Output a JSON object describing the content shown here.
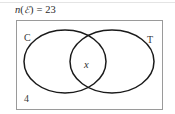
{
  "problem": {
    "statement_function": "n",
    "statement_open": "(",
    "statement_universal_symbol": "ℰ",
    "statement_close": ")",
    "statement_equals": "=",
    "statement_total": "23",
    "statement_full": "n(ℰ) = 23"
  },
  "diagram": {
    "type": "venn-two-set",
    "universal_rectangle_label": "",
    "sets": [
      {
        "id": "C",
        "label": "C",
        "position": "top-left"
      },
      {
        "id": "T",
        "label": "T",
        "position": "top-right"
      }
    ],
    "regions": [
      {
        "id": "intersection",
        "label": "x",
        "description": "C and T"
      },
      {
        "id": "outside",
        "label": "4",
        "description": "outside both sets"
      }
    ]
  },
  "colors": {
    "stroke": "#1a1a1a",
    "rect_stroke": "#9a9a9a",
    "text": "#2b2b2b",
    "background": "#ffffff",
    "top_rule": "#e4e4e4"
  }
}
